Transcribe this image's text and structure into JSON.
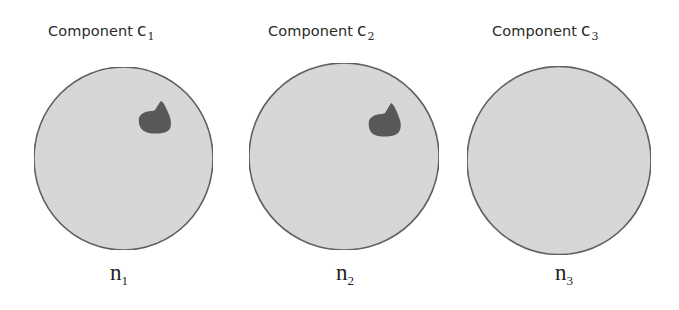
{
  "components": [
    {
      "title_prefix": "Component",
      "var": "c",
      "index": "1",
      "node_var": "n",
      "node_index": "1",
      "has_blob": true
    },
    {
      "title_prefix": "Component",
      "var": "c",
      "index": "2",
      "node_var": "n",
      "node_index": "2",
      "has_blob": true
    },
    {
      "title_prefix": "Component",
      "var": "c",
      "index": "3",
      "node_var": "n",
      "node_index": "3",
      "has_blob": false
    }
  ],
  "colors": {
    "circle_fill": "#d8d8d8",
    "circle_stroke": "#5a5a5a",
    "blob_fill": "#585858",
    "text": "#2b2b2b"
  }
}
